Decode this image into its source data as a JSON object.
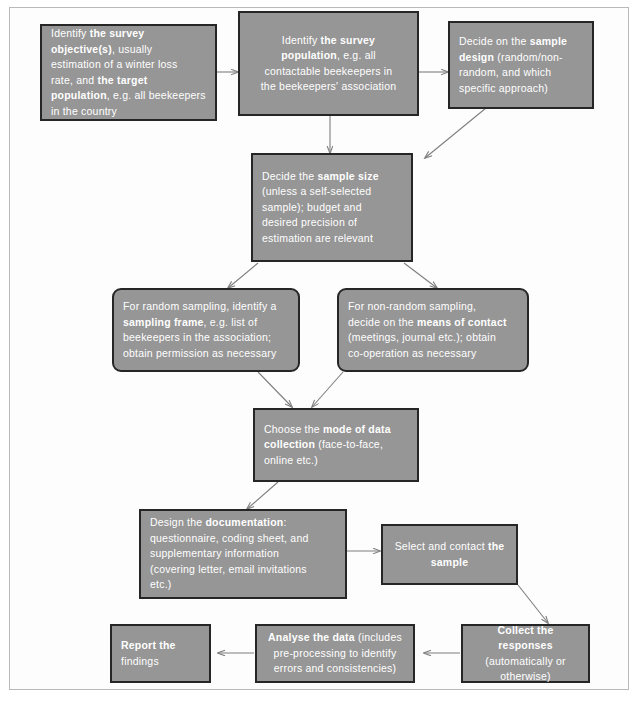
{
  "diagram": {
    "node_fill": "#969696",
    "node_border": "#262626",
    "text_color": "#ffffff",
    "arrow_color": "#7f7f7f",
    "frame_color": "#b9b9b9",
    "background": "#ffffff"
  },
  "nodes": {
    "objective": {
      "name": "identify-survey-objective",
      "lines": [
        "Identify <b>the survey</b>",
        "<b>objective(s)</b>, usually",
        "estimation  of a winter loss",
        "rate, and <b>the target</b>",
        "<b>population</b>, e.g. all beekeepers",
        "in the country"
      ],
      "plain": "Identify the survey objective(s), usually estimation of a winter loss rate, and the target population, e.g. all beekeepers in the country"
    },
    "population": {
      "name": "identify-survey-population",
      "lines": [
        "Identify <b>the survey</b>",
        "<b>population</b>, e.g. all",
        "contactable beekeepers in",
        "the beekeepers' association"
      ],
      "plain": "Identify the survey population, e.g. all contactable beekeepers in the beekeepers' association"
    },
    "design": {
      "name": "decide-sample-design",
      "lines": [
        "Decide on the <b>sample</b>",
        "<b>design</b> (random/non-",
        "random,  and which",
        "specific approach)"
      ],
      "plain": "Decide on the sample design (random/non-random, and which specific approach)"
    },
    "size": {
      "name": "decide-sample-size",
      "lines": [
        "Decide the <b>sample size</b>",
        "(unless a self-selected",
        "sample);   budget and",
        "desired precision of",
        "estimation are relevant"
      ],
      "plain": "Decide the sample size (unless a self-selected sample); budget and desired precision of estimation are relevant"
    },
    "random": {
      "name": "random-sampling-frame",
      "lines": [
        "For random sampling, identify a",
        "<b>sampling frame</b>, e.g. list of",
        "beekeepers in the association;",
        "obtain permission as necessary"
      ],
      "plain": "For random sampling, identify a sampling frame, e.g. list of beekeepers in the association; obtain permission as necessary"
    },
    "nonrandom": {
      "name": "non-random-means-of-contact",
      "lines": [
        "For non-random sampling,",
        "decide on the <b>means of contact</b>",
        "(meetings, journal etc.); obtain",
        "co-operation as necessary"
      ],
      "plain": "For non-random sampling, decide on the means of contact (meetings, journal etc.); obtain co-operation as necessary"
    },
    "mode": {
      "name": "choose-mode-of-data-collection",
      "lines": [
        "Choose the <b>mode of data</b>",
        "<b>collection</b> (face-to-face,",
        "online etc.)"
      ],
      "plain": "Choose the mode of data collection (face-to-face, online etc.)"
    },
    "documentation": {
      "name": "design-the-documentation",
      "lines": [
        "Design the <b>documentation</b>:",
        "questionnaire, coding sheet, and",
        "supplementary information",
        "(covering letter, email invitations",
        "etc.)"
      ],
      "plain": "Design the documentation: questionnaire, coding sheet, and supplementary information (covering letter, email invitations etc.)"
    },
    "select": {
      "name": "select-and-contact-sample",
      "lines": [
        "Select and contact <b>the</b>",
        "<b>sample</b>"
      ],
      "plain": "Select and contact the sample"
    },
    "collect": {
      "name": "collect-the-responses",
      "lines": [
        "<b>Collect the responses</b>",
        "(automatically or",
        "otherwise)"
      ],
      "plain": "Collect the responses (automatically or otherwise)"
    },
    "analyse": {
      "name": "analyse-the-data",
      "lines": [
        "<b>Analyse the data</b> (includes",
        "pre-processing to identify",
        "errors and consistencies)"
      ],
      "plain": "Analyse the data (includes pre-processing to identify errors and consistencies)"
    },
    "report": {
      "name": "report-the-findings",
      "lines": [
        "<b>Report the</b>",
        "findings"
      ],
      "plain": "Report the findings"
    }
  },
  "arrows": [
    {
      "name": "arrow-objective-to-population",
      "from": "objective",
      "to": "population"
    },
    {
      "name": "arrow-population-to-design",
      "from": "population",
      "to": "design"
    },
    {
      "name": "arrow-design-to-size",
      "from": "design",
      "to": "size"
    },
    {
      "name": "arrow-population-to-size",
      "from": "population",
      "to": "size"
    },
    {
      "name": "arrow-size-to-random",
      "from": "size",
      "to": "random"
    },
    {
      "name": "arrow-size-to-nonrandom",
      "from": "size",
      "to": "nonrandom"
    },
    {
      "name": "arrow-random-to-mode",
      "from": "random",
      "to": "mode"
    },
    {
      "name": "arrow-nonrandom-to-mode",
      "from": "nonrandom",
      "to": "mode"
    },
    {
      "name": "arrow-mode-to-documentation",
      "from": "mode",
      "to": "documentation"
    },
    {
      "name": "arrow-documentation-to-select",
      "from": "documentation",
      "to": "select"
    },
    {
      "name": "arrow-select-to-collect",
      "from": "select",
      "to": "collect"
    },
    {
      "name": "arrow-collect-to-analyse",
      "from": "collect",
      "to": "analyse"
    },
    {
      "name": "arrow-analyse-to-report",
      "from": "analyse",
      "to": "report"
    }
  ]
}
